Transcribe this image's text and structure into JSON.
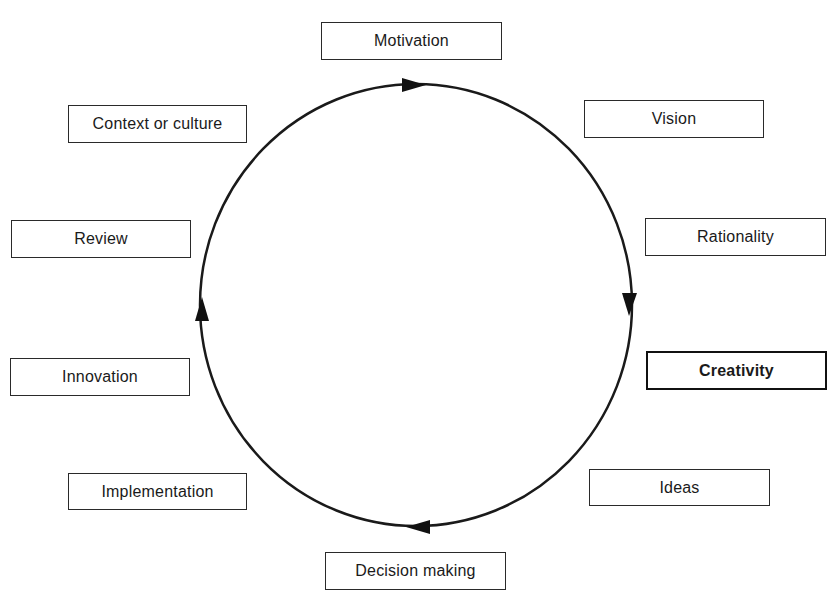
{
  "diagram": {
    "type": "cycle",
    "direction": "clockwise",
    "colors": {
      "line": "#1a1a1a",
      "box_border": "#2a2a2a",
      "background": "#ffffff"
    },
    "nodes": [
      {
        "id": "motivation",
        "label": "Motivation",
        "emphasized": false
      },
      {
        "id": "vision",
        "label": "Vision",
        "emphasized": false
      },
      {
        "id": "rationality",
        "label": "Rationality",
        "emphasized": false
      },
      {
        "id": "creativity",
        "label": "Creativity",
        "emphasized": true
      },
      {
        "id": "ideas",
        "label": "Ideas",
        "emphasized": false
      },
      {
        "id": "decision-making",
        "label": "Decision making",
        "emphasized": false
      },
      {
        "id": "implementation",
        "label": "Implementation",
        "emphasized": false
      },
      {
        "id": "innovation",
        "label": "Innovation",
        "emphasized": false
      },
      {
        "id": "review",
        "label": "Review",
        "emphasized": false
      },
      {
        "id": "context-or-culture",
        "label": "Context or culture",
        "emphasized": false
      }
    ],
    "arrows": [
      {
        "position": "top",
        "points": "right"
      },
      {
        "position": "right",
        "points": "down"
      },
      {
        "position": "bottom",
        "points": "left"
      },
      {
        "position": "left",
        "points": "up"
      }
    ]
  }
}
